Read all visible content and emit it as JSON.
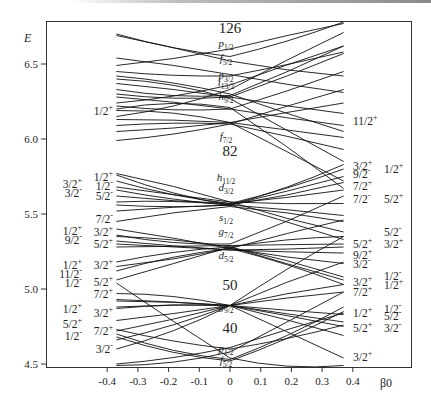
{
  "chart_data": {
    "type": "line",
    "xlabel": "β0",
    "ylabel": "E",
    "xlim": [
      -0.45,
      0.45
    ],
    "ylim": [
      4.49,
      6.8
    ],
    "x_ticks": [
      -0.4,
      -0.3,
      -0.2,
      -0.1,
      0,
      0.1,
      0.2,
      0.3,
      0.4
    ],
    "x_tick_labels": [
      "-0.4",
      "-0.3",
      "-0.2",
      "-0.1",
      "0",
      "0.1",
      "0.2",
      "0.3",
      "0.4"
    ],
    "y_ticks": [
      4.5,
      5.0,
      5.5,
      6.0,
      6.5
    ],
    "y_tick_labels": [
      "4.5",
      "5.0",
      "5.5",
      "6.0",
      "6.5"
    ],
    "grid": false,
    "magic_numbers": [
      {
        "label": "126",
        "E": 6.74
      },
      {
        "label": "82",
        "E": 5.92
      },
      {
        "label": "50",
        "E": 5.03
      },
      {
        "label": "40",
        "E": 4.74
      }
    ],
    "spherical_orbitals": [
      {
        "l": "p",
        "j": "1/2",
        "E": 6.64
      },
      {
        "l": "f",
        "j": "5/2",
        "E": 6.54
      },
      {
        "l": "p",
        "j": "3/2",
        "E": 6.43
      },
      {
        "l": "i",
        "j": "13/2",
        "E": 6.38
      },
      {
        "l": "h",
        "j": "9/2",
        "E": 6.29
      },
      {
        "l": "f",
        "j": "7/2",
        "E": 6.02
      },
      {
        "l": "h",
        "j": "11/2",
        "E": 5.75
      },
      {
        "l": "d",
        "j": "3/2",
        "E": 5.68
      },
      {
        "l": "s",
        "j": "1/2",
        "E": 5.48
      },
      {
        "l": "g",
        "j": "7/2",
        "E": 5.39
      },
      {
        "l": "d",
        "j": "5/2",
        "E": 5.23
      },
      {
        "l": "g",
        "j": "9/2",
        "E": 4.89
      },
      {
        "l": "p",
        "j": "1/2",
        "E": 4.61
      },
      {
        "l": "f",
        "j": "5/2",
        "E": 4.53
      }
    ],
    "left_labels_inner": [
      {
        "text": "1/2",
        "parity": "+",
        "E": 6.19
      },
      {
        "text": "1/2",
        "parity": "+",
        "E": 5.75
      },
      {
        "text": "1/2",
        "parity": "-",
        "E": 5.69
      },
      {
        "text": "5/2",
        "parity": "-",
        "E": 5.62
      },
      {
        "text": "7/2",
        "parity": "-",
        "E": 5.47
      },
      {
        "text": "3/2",
        "parity": "+",
        "E": 5.38
      },
      {
        "text": "5/2",
        "parity": "+",
        "E": 5.3
      },
      {
        "text": "3/2",
        "parity": "+",
        "E": 5.16
      },
      {
        "text": "5/2",
        "parity": "+",
        "E": 5.05
      },
      {
        "text": "7/2",
        "parity": "+",
        "E": 4.97
      },
      {
        "text": "3/2",
        "parity": "+",
        "E": 4.84
      },
      {
        "text": "7/2",
        "parity": "+",
        "E": 4.72
      },
      {
        "text": "3/2",
        "parity": "-",
        "E": 4.6
      }
    ],
    "left_labels_outer": [
      {
        "text": "3/2",
        "parity": "+",
        "E": 5.7
      },
      {
        "text": "3/2",
        "parity": "-",
        "E": 5.64
      },
      {
        "text": "1/2",
        "parity": "+",
        "E": 5.39
      },
      {
        "text": "9/2",
        "parity": "-",
        "E": 5.33
      },
      {
        "text": "1/2",
        "parity": "+",
        "E": 5.16
      },
      {
        "text": "11/2",
        "parity": "-",
        "E": 5.1
      },
      {
        "text": "1/2",
        "parity": "-",
        "E": 5.04
      },
      {
        "text": "1/2",
        "parity": "+",
        "E": 4.87
      },
      {
        "text": "5/2",
        "parity": "+",
        "E": 4.77
      },
      {
        "text": "1/2",
        "parity": "-",
        "E": 4.69
      }
    ],
    "right_labels_inner": [
      {
        "text": "11/2",
        "parity": "+",
        "E": 6.12
      },
      {
        "text": "3/2",
        "parity": "+",
        "E": 5.82
      },
      {
        "text": "9/2",
        "parity": "-",
        "E": 5.77
      },
      {
        "text": "7/2",
        "parity": "+",
        "E": 5.69
      },
      {
        "text": "7/2",
        "parity": "-",
        "E": 5.6
      },
      {
        "text": "5/2",
        "parity": "+",
        "E": 5.3
      },
      {
        "text": "9/2",
        "parity": "+",
        "E": 5.23
      },
      {
        "text": "3/2",
        "parity": "-",
        "E": 5.17
      },
      {
        "text": "3/2",
        "parity": "+",
        "E": 5.05
      },
      {
        "text": "7/2",
        "parity": "+",
        "E": 4.98
      },
      {
        "text": "1/2",
        "parity": "+",
        "E": 4.84
      },
      {
        "text": "5/2",
        "parity": "+",
        "E": 4.74
      },
      {
        "text": "3/2",
        "parity": "+",
        "E": 4.55
      }
    ],
    "right_labels_outer": [
      {
        "text": "1/2",
        "parity": "+",
        "E": 5.8
      },
      {
        "text": "5/2",
        "parity": "+",
        "E": 5.6
      },
      {
        "text": "5/2",
        "parity": "-",
        "E": 5.38
      },
      {
        "text": "3/2",
        "parity": "+",
        "E": 5.3
      },
      {
        "text": "1/2",
        "parity": "-",
        "E": 5.09
      },
      {
        "text": "1/2",
        "parity": "+",
        "E": 5.03
      },
      {
        "text": "1/2",
        "parity": "-",
        "E": 4.87
      },
      {
        "text": "5/2",
        "parity": "-",
        "E": 4.82
      },
      {
        "text": "3/2",
        "parity": "-",
        "E": 4.74
      }
    ],
    "series": [
      {
        "name": "g9/2 fan",
        "x": [
          -0.37,
          0,
          0.37
        ],
        "E_pts": [
          [
            4.87,
            4.89,
            4.69
          ],
          [
            4.88,
            4.89,
            4.75
          ],
          [
            4.72,
            4.89,
            5.03
          ],
          [
            4.79,
            4.89,
            4.98
          ],
          [
            4.92,
            4.89,
            4.78
          ],
          [
            4.93,
            4.89,
            4.83
          ],
          [
            4.97,
            4.89,
            4.54
          ],
          [
            4.66,
            4.89,
            5.18
          ],
          [
            4.6,
            4.89,
            5.35
          ]
        ]
      },
      {
        "name": "p1/2 f5/2 fan",
        "x": [
          -0.37,
          0,
          0.37
        ],
        "E_pts": [
          [
            4.7,
            4.53,
            4.88
          ],
          [
            4.68,
            4.52,
            4.85
          ],
          [
            5.04,
            4.54,
            4.49
          ],
          [
            4.5,
            4.61,
            4.84
          ],
          [
            4.73,
            4.6,
            4.76
          ],
          [
            4.49,
            4.58,
            4.98
          ]
        ]
      },
      {
        "name": "d5/2 g7/2 fan",
        "x": [
          -0.37,
          0,
          0.37
        ],
        "E_pts": [
          [
            5.12,
            5.27,
            5.03
          ],
          [
            5.18,
            5.28,
            5.08
          ],
          [
            5.06,
            5.28,
            5.35
          ],
          [
            5.15,
            5.27,
            5.46
          ],
          [
            5.3,
            5.26,
            5.24
          ],
          [
            5.32,
            5.26,
            5.28
          ],
          [
            5.35,
            5.28,
            5.06
          ],
          [
            5.4,
            5.27,
            5.17
          ],
          [
            5.28,
            5.29,
            5.3
          ],
          [
            5.36,
            5.3,
            5.62
          ]
        ]
      },
      {
        "name": "s1/2 d3/2 h11/2 fan",
        "x": [
          -0.37,
          0,
          0.37
        ],
        "E_pts": [
          [
            5.45,
            5.55,
            5.45
          ],
          [
            5.52,
            5.56,
            5.49
          ],
          [
            5.58,
            5.56,
            5.33
          ],
          [
            5.62,
            5.57,
            5.66
          ],
          [
            5.66,
            5.56,
            5.71
          ],
          [
            5.72,
            5.57,
            5.8
          ],
          [
            5.76,
            5.56,
            5.83
          ],
          [
            5.68,
            5.58,
            5.57
          ],
          [
            5.56,
            5.56,
            5.75
          ],
          [
            5.77,
            5.58,
            5.38
          ]
        ]
      },
      {
        "name": "f7/2 h9/2 i13/2 fan",
        "x": [
          -0.37,
          0,
          0.37
        ],
        "E_pts": [
          [
            5.99,
            6.1,
            6.33
          ],
          [
            6.05,
            6.11,
            6.24
          ],
          [
            6.09,
            6.1,
            5.93
          ],
          [
            6.13,
            6.11,
            6.01
          ],
          [
            6.19,
            6.11,
            5.72
          ],
          [
            6.22,
            6.2,
            6.45
          ],
          [
            6.28,
            6.2,
            6.09
          ],
          [
            6.2,
            6.21,
            5.67
          ],
          [
            6.3,
            6.28,
            6.57
          ],
          [
            6.37,
            6.28,
            6.17
          ],
          [
            6.4,
            6.27,
            5.85
          ],
          [
            6.33,
            6.29,
            6.62
          ],
          [
            6.42,
            6.3,
            6.05
          ],
          [
            6.45,
            6.42,
            6.58
          ],
          [
            6.54,
            6.43,
            6.31
          ],
          [
            6.69,
            6.52,
            6.42
          ],
          [
            6.7,
            6.55,
            6.78
          ],
          [
            6.49,
            6.6,
            6.77
          ],
          [
            6.24,
            6.36,
            6.62
          ],
          [
            6.15,
            6.33,
            6.71
          ]
        ]
      }
    ]
  }
}
